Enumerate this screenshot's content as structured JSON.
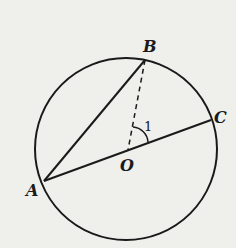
{
  "diagram": {
    "type": "circle-geometry",
    "circle": {
      "center": "O",
      "cx": 126,
      "cy": 149,
      "r": 91
    },
    "points": [
      {
        "name": "A",
        "x": 44,
        "y": 181,
        "label": "A",
        "lx": 26,
        "ly": 196
      },
      {
        "name": "B",
        "x": 145,
        "y": 60,
        "label": "B",
        "lx": 143,
        "ly": 52
      },
      {
        "name": "C",
        "x": 211,
        "y": 120,
        "label": "C",
        "lx": 214,
        "ly": 123
      },
      {
        "name": "O",
        "x": 128,
        "y": 150,
        "label": "O",
        "lx": 120,
        "ly": 171
      }
    ],
    "segments": [
      {
        "from": "A",
        "to": "B",
        "style": "solid"
      },
      {
        "from": "A",
        "to": "C",
        "style": "solid",
        "note": "diameter through O"
      },
      {
        "from": "B",
        "to": "O",
        "style": "dashed"
      }
    ],
    "angle": {
      "label": "1",
      "vertex": "O",
      "between": [
        "OB",
        "OC"
      ]
    },
    "colors": {
      "line": "#1a1a1a",
      "background": "#efefec"
    }
  },
  "labels": {
    "A": "A",
    "B": "B",
    "C": "C",
    "O": "O",
    "angle1": "1"
  }
}
